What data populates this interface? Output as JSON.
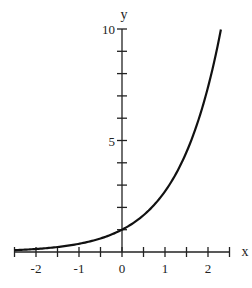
{
  "chart_data": {
    "type": "line",
    "title": "",
    "function": "y = e^x",
    "xlabel": "x",
    "ylabel": "y",
    "xlim": [
      -2.5,
      2.5
    ],
    "ylim": [
      0,
      10
    ],
    "x_ticks": [
      -2.5,
      -2,
      -1.5,
      -1,
      -0.5,
      0,
      0.5,
      1,
      1.5,
      2,
      2.5
    ],
    "x_tick_labels": [
      {
        "value": -2,
        "label": "-2"
      },
      {
        "value": -1,
        "label": "-1"
      },
      {
        "value": 0,
        "label": "0"
      },
      {
        "value": 1,
        "label": "1"
      },
      {
        "value": 2,
        "label": "2"
      }
    ],
    "y_ticks": [
      0,
      1,
      2,
      3,
      4,
      5,
      6,
      7,
      8,
      9,
      10
    ],
    "y_tick_labels": [
      {
        "value": 5,
        "label": "5"
      },
      {
        "value": 10,
        "label": "10"
      }
    ],
    "grid": false,
    "legend": null,
    "series": [
      {
        "name": "e^x",
        "color": "#111111",
        "x": [
          -2.5,
          -2,
          -1.5,
          -1,
          -0.5,
          0,
          0.5,
          1,
          1.5,
          2,
          2.3
        ],
        "y": [
          0.08,
          0.14,
          0.22,
          0.37,
          0.61,
          1.0,
          1.65,
          2.72,
          4.48,
          7.39,
          9.97
        ]
      }
    ]
  }
}
